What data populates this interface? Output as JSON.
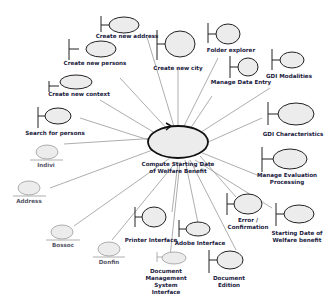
{
  "diagram": {
    "type": "UML robustness diagram",
    "colors": {
      "ellipse_fill": "#ececec",
      "outline": "#222222",
      "link": "#8a8a8a",
      "label": "#1a1a40"
    },
    "control": {
      "label_line1": "Compute Starting Date",
      "label_line2": "of Welfare Benefit"
    },
    "boundaries": [
      {
        "id": "create-new-address",
        "label": "Create new address"
      },
      {
        "id": "create-new-city",
        "label": "Create new city"
      },
      {
        "id": "folder-explorer",
        "label": "Folder explorer"
      },
      {
        "id": "create-new-persons",
        "label": "Create new persons"
      },
      {
        "id": "manage-data-entry",
        "label": "Manage Data Entry"
      },
      {
        "id": "gdi-modalities",
        "label": "GDI Modalities"
      },
      {
        "id": "create-new-context",
        "label": "Create new context"
      },
      {
        "id": "search-for-persons",
        "label": "Search for persons"
      },
      {
        "id": "gdi-characteristics",
        "label": "GDI Characteristics"
      },
      {
        "id": "manage-evaluation-processing",
        "label_line1": "Manage Evaluation",
        "label_line2": "Processing"
      },
      {
        "id": "error-confirmation",
        "label_line1": "Error /",
        "label_line2": "Confirmation"
      },
      {
        "id": "starting-date-welfare-benefit",
        "label_line1": "Starting Date of",
        "label_line2": "Welfare benefit"
      },
      {
        "id": "printer-interface",
        "label": "Printer Interface"
      },
      {
        "id": "adobe-interface",
        "label": "Adobe Interface"
      },
      {
        "id": "document-management-system-interface",
        "label_line1": "Document",
        "label_line2": "Management",
        "label_line3": "System",
        "label_line4": "Interface"
      },
      {
        "id": "document-edition",
        "label_line1": "Document",
        "label_line2": "Edition"
      }
    ],
    "entities": [
      {
        "id": "indivi",
        "label": "Indivi"
      },
      {
        "id": "address",
        "label": "Address"
      },
      {
        "id": "bossoc",
        "label": "Bossoc"
      },
      {
        "id": "donfin",
        "label": "Donfin"
      }
    ]
  }
}
